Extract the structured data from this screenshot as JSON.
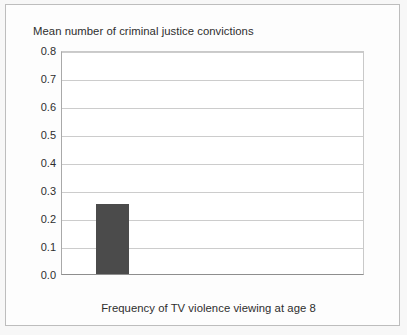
{
  "figure": {
    "background_color": "#f7f7f7",
    "panel_color": "#fdfdfd",
    "border_color": "#bdbdbd"
  },
  "chart_data": {
    "type": "bar",
    "title": "Mean number of criminal justice convictions",
    "xlabel": "Frequency of TV violence viewing at age 8",
    "ylabel": "Mean number of criminal justice convictions",
    "categories": [
      "Low",
      "Medium",
      "High"
    ],
    "values": [
      0.25,
      0.35,
      0.77
    ],
    "ylim": [
      0.0,
      0.8
    ],
    "ytick_labels": [
      "0.8",
      "0.7",
      "0.6",
      "0.5",
      "0.4",
      "0.3",
      "0.2",
      "0.1",
      "0.0"
    ],
    "ytick_values": [
      0.8,
      0.7,
      0.6,
      0.5,
      0.4,
      0.3,
      0.2,
      0.1,
      0.0
    ],
    "ytick_step": 0.1,
    "grid": "horizontal",
    "legend": "none",
    "bar_color": "#4b4b4b",
    "gridline_color": "#cccccc",
    "axis_color": "#8e8e8e",
    "text_color": "#2e2e2e"
  }
}
